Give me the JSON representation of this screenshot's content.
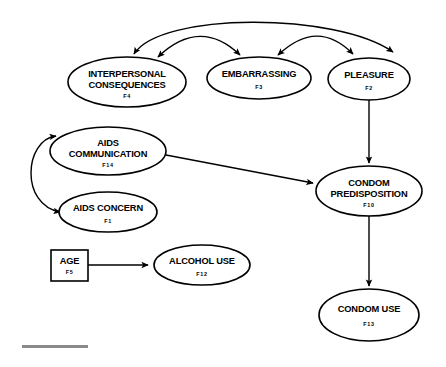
{
  "diagram": {
    "type": "path-diagram",
    "background_color": "#ffffff",
    "stroke_color": "#000000",
    "footer_rule_color": "#8a8a8a",
    "nodes": [
      {
        "id": "F4",
        "shape": "ellipse",
        "label_lines": [
          "INTERPERSONAL",
          "CONSEQUENCES"
        ],
        "line1": "INTERPERSONAL",
        "line2": "CONSEQUENCES",
        "code": "F4",
        "cx": 127,
        "cy": 82,
        "rx": 59,
        "ry": 25
      },
      {
        "id": "F3",
        "shape": "ellipse",
        "label_lines": [
          "EMBARRASSING"
        ],
        "line1": "EMBARRASSING",
        "line2": "",
        "code": "F3",
        "cx": 259,
        "cy": 78,
        "rx": 52,
        "ry": 21
      },
      {
        "id": "F2",
        "shape": "ellipse",
        "label_lines": [
          "PLEASURE"
        ],
        "line1": "PLEASURE",
        "line2": "",
        "code": "F2",
        "cx": 369,
        "cy": 79,
        "rx": 41,
        "ry": 21
      },
      {
        "id": "F14",
        "shape": "ellipse",
        "label_lines": [
          "AIDS",
          "COMMUNICATION"
        ],
        "line1": "AIDS",
        "line2": "COMMUNICATION",
        "code": "F14",
        "cx": 108,
        "cy": 151,
        "rx": 58,
        "ry": 24
      },
      {
        "id": "F1",
        "shape": "ellipse",
        "label_lines": [
          "AIDS CONCERN"
        ],
        "line1": "AIDS CONCERN",
        "line2": "",
        "code": "F1",
        "cx": 108,
        "cy": 212,
        "rx": 49,
        "ry": 20
      },
      {
        "id": "F5",
        "shape": "rect",
        "label_lines": [
          "AGE"
        ],
        "line1": "AGE",
        "line2": "",
        "code": "F5",
        "x": 51,
        "y": 250,
        "width": 37,
        "height": 31
      },
      {
        "id": "F12",
        "shape": "ellipse",
        "label_lines": [
          "ALCOHOL USE"
        ],
        "line1": "ALCOHOL USE",
        "line2": "",
        "code": "F12",
        "cx": 202,
        "cy": 265,
        "rx": 48,
        "ry": 20
      },
      {
        "id": "F10",
        "shape": "ellipse",
        "label_lines": [
          "CONDOM",
          "PREDISPOSITION"
        ],
        "line1": "CONDOM",
        "line2": "PREDISPOSITION",
        "code": "F10",
        "cx": 369,
        "cy": 191,
        "rx": 53,
        "ry": 25
      },
      {
        "id": "F13",
        "shape": "ellipse",
        "label_lines": [
          "CONDOM USE"
        ],
        "line1": "CONDOM USE",
        "line2": "",
        "code": "F13",
        "cx": 369,
        "cy": 315,
        "rx": 50,
        "ry": 26
      }
    ],
    "edges": [
      {
        "id": "e-f4-f3",
        "from": "F4",
        "to": "F3",
        "kind": "covariance",
        "style": "double-headed-curve"
      },
      {
        "id": "e-f3-f2",
        "from": "F3",
        "to": "F2",
        "kind": "covariance",
        "style": "double-headed-curve"
      },
      {
        "id": "e-f4-f2",
        "from": "F4",
        "to": "F2",
        "kind": "covariance",
        "style": "double-headed-curve"
      },
      {
        "id": "e-f14-f1",
        "from": "F14",
        "to": "F1",
        "kind": "covariance",
        "style": "double-headed-curve"
      },
      {
        "id": "e-f2-f10",
        "from": "F2",
        "to": "F10",
        "kind": "regression",
        "style": "single-headed-straight"
      },
      {
        "id": "e-f14-f10",
        "from": "F14",
        "to": "F10",
        "kind": "regression",
        "style": "single-headed-straight"
      },
      {
        "id": "e-f5-f12",
        "from": "F5",
        "to": "F12",
        "kind": "regression",
        "style": "single-headed-straight"
      },
      {
        "id": "e-f10-f13",
        "from": "F10",
        "to": "F13",
        "kind": "regression",
        "style": "single-headed-straight"
      }
    ]
  }
}
